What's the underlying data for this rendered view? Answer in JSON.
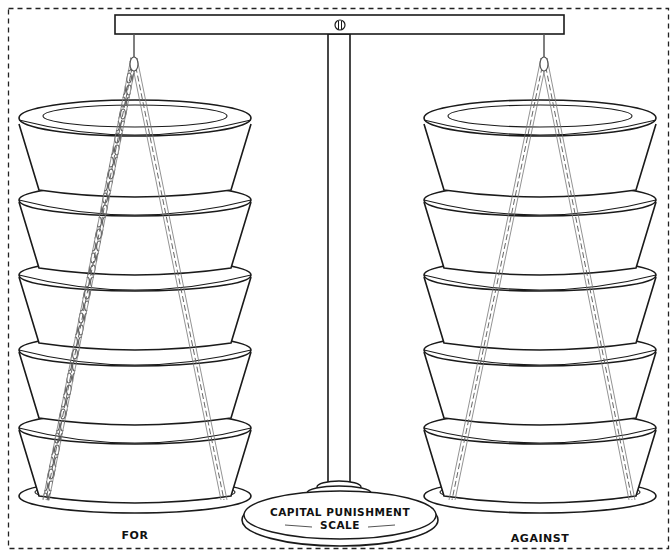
{
  "diagram": {
    "title": "CAPITAL PUNISHMENT SCALE",
    "base_label_line1": "CAPITAL PUNISHMENT",
    "base_label_line2": "SCALE",
    "left_pan": {
      "label": "FOR",
      "weight_count": 5
    },
    "right_pan": {
      "label": "AGAINST",
      "weight_count": 5
    },
    "colors": {
      "line": "#1a1a1a",
      "chain": "#555555",
      "background": "#ffffff"
    }
  }
}
